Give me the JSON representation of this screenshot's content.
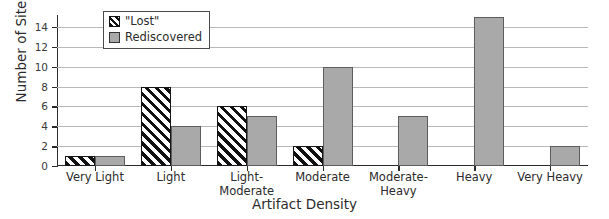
{
  "chart_data": {
    "type": "bar",
    "title": "",
    "xlabel": "Artifact Density",
    "ylabel": "Number of Sites",
    "categories": [
      "Very Light",
      "Light",
      "Light-Moderate",
      "Moderate",
      "Moderate-Heavy",
      "Heavy",
      "Very Heavy"
    ],
    "category_lines": [
      [
        "Very Light"
      ],
      [
        "Light"
      ],
      [
        "Light-",
        "Moderate"
      ],
      [
        "Moderate"
      ],
      [
        "Moderate-",
        "Heavy"
      ],
      [
        "Heavy"
      ],
      [
        "Very Heavy"
      ]
    ],
    "series": [
      {
        "name": "\"Lost\"",
        "values": [
          1,
          8,
          6,
          2,
          0,
          0,
          0
        ],
        "style": "diagonal-hatch",
        "color": "#111111"
      },
      {
        "name": "Rediscovered",
        "values": [
          1,
          4,
          5,
          10,
          5,
          15,
          2
        ],
        "style": "solid-fill",
        "color": "#a9a9a9"
      }
    ],
    "ylim": [
      0,
      15.2
    ],
    "yticks": [
      0,
      2,
      4,
      6,
      8,
      10,
      12,
      14
    ],
    "ytick_labels": [
      "0",
      "2",
      "4",
      "6",
      "8",
      "10",
      "12",
      "14"
    ],
    "grid": "horizontal",
    "legend_position": "top-left-inside"
  }
}
